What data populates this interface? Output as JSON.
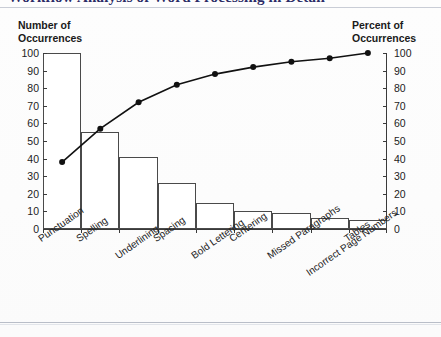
{
  "document": {
    "title_clipped": "Workflow Analysis of Word Processing in Detail",
    "title_accent_word": "Word"
  },
  "axes": {
    "left_caption_line1": "Number of",
    "left_caption_line2": "Occurrences",
    "right_caption_line1": "Percent of",
    "right_caption_line2": "Occurrences",
    "left_ticks": [
      "100",
      "90",
      "80",
      "70",
      "60",
      "50",
      "40",
      "30",
      "20",
      "10",
      "0"
    ],
    "right_ticks": [
      "100",
      "90",
      "80",
      "70",
      "60",
      "50",
      "40",
      "30",
      "20",
      "10",
      "0"
    ]
  },
  "chart_data": {
    "type": "bar",
    "title": "Workflow Analysis of Word Processing in Detail",
    "xlabel": "",
    "ylabel": "Number of Occurrences",
    "y2label": "Percent of Occurrences",
    "ylim": [
      0,
      100
    ],
    "y2lim": [
      0,
      100
    ],
    "ytick_step": 10,
    "grid": false,
    "legend": "none",
    "categories": [
      "Punctuation",
      "Spelling",
      "Underlining",
      "Spacing",
      "Bold Lettering",
      "Centering",
      "Missed Paragraphs",
      "Incorrect Page Numbers",
      "Tables"
    ],
    "series": [
      {
        "name": "Number of Occurrences",
        "type": "bar",
        "values": [
          100,
          55,
          41,
          26,
          15,
          10,
          9,
          6,
          5
        ]
      },
      {
        "name": "Cumulative Percent of Occurrences",
        "type": "line",
        "axis": "right",
        "values": [
          38,
          57,
          72,
          82,
          88,
          92,
          95,
          97,
          100
        ]
      }
    ]
  },
  "colors": {
    "bar_fill": "#ffffff",
    "bar_stroke": "#4a4a4a",
    "line": "#111111",
    "axis": "#3a3a3a",
    "text": "#1c1c1c",
    "title": "#2b2b66",
    "title_accent": "#8b2b2b"
  }
}
